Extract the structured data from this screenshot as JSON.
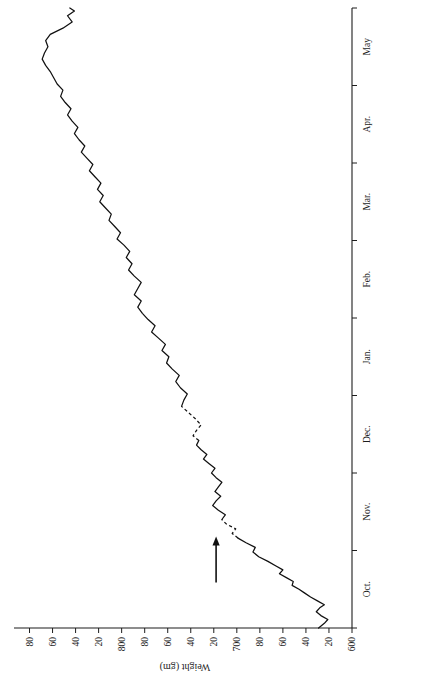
{
  "figure": {
    "name": "weight-growth-curve",
    "orientation_note": "rotated",
    "line_color": "#111111",
    "axis_color": "#1d1d1d",
    "background": "#ffffff"
  },
  "chart_data": {
    "type": "line",
    "title": "",
    "subtitle": "",
    "xlabel": "",
    "ylabel": "Weight (gm)",
    "grid": false,
    "legend": null,
    "ylim": [
      600,
      890
    ],
    "xlim": [
      0,
      8
    ],
    "y_ticks": [
      600,
      620,
      640,
      660,
      680,
      700,
      720,
      740,
      760,
      780,
      800,
      820,
      840,
      860,
      880
    ],
    "y_tick_labels": [
      "600",
      "20",
      "40",
      "60",
      "80",
      "700",
      "20",
      "40",
      "60",
      "80",
      "800",
      "20",
      "40",
      "60",
      "80"
    ],
    "x_ticks": [
      0,
      1,
      2,
      3,
      4,
      5,
      6,
      7,
      8
    ],
    "x_tick_labels": [
      "",
      "",
      "",
      "",
      "",
      "",
      "",
      "",
      ""
    ],
    "categories": [
      "Oct.",
      "Nov.",
      "Dec.",
      "Jan.",
      "Feb.",
      "Mar.",
      "Apr.",
      "May"
    ],
    "month_label_positions": [
      0.5,
      1.5,
      2.5,
      3.5,
      4.5,
      5.5,
      6.5,
      7.5
    ],
    "annotations": [
      {
        "name": "marker-arrow",
        "type": "arrow",
        "x": 1.18,
        "y": 718,
        "direction": "right",
        "text": ""
      }
    ],
    "series": [
      {
        "name": "body-weight",
        "style": "solid-with-interpolated-gaps",
        "x": [
          0.0,
          0.06,
          0.11,
          0.16,
          0.21,
          0.26,
          0.3,
          0.35,
          0.4,
          0.45,
          0.5,
          0.55,
          0.6,
          0.65,
          0.7,
          0.75,
          0.8,
          0.86,
          0.92,
          0.98,
          1.04,
          1.1,
          1.16,
          1.22,
          1.28,
          1.34,
          1.4,
          1.46,
          1.52,
          1.58,
          1.64,
          1.7,
          1.76,
          1.82,
          1.88,
          1.94,
          2.0,
          2.06,
          2.12,
          2.18,
          2.24,
          2.3,
          2.36,
          2.42,
          2.48,
          2.55,
          2.62,
          2.7,
          2.78,
          2.86,
          2.94,
          3.02,
          3.1,
          3.18,
          3.26,
          3.34,
          3.42,
          3.5,
          3.58,
          3.66,
          3.74,
          3.82,
          3.9,
          3.98,
          4.06,
          4.14,
          4.22,
          4.3,
          4.38,
          4.46,
          4.54,
          4.62,
          4.7,
          4.78,
          4.86,
          4.94,
          5.02,
          5.1,
          5.18,
          5.26,
          5.34,
          5.42,
          5.5,
          5.58,
          5.66,
          5.74,
          5.82,
          5.9,
          5.98,
          6.06,
          6.14,
          6.22,
          6.3,
          6.38,
          6.46,
          6.54,
          6.62,
          6.7,
          6.78,
          6.86,
          6.94,
          7.02,
          7.1,
          7.18,
          7.26,
          7.34,
          7.42,
          7.5,
          7.58,
          7.66,
          7.74,
          7.82,
          7.9,
          7.96,
          8.0
        ],
        "y": [
          629,
          624,
          621,
          627,
          631,
          628,
          624,
          630,
          636,
          641,
          646,
          652,
          651,
          657,
          663,
          660,
          666,
          673,
          681,
          686,
          684,
          692,
          699,
          704,
          701,
          709,
          713,
          710,
          716,
          721,
          718,
          714,
          719,
          716,
          713,
          718,
          722,
          719,
          724,
          729,
          726,
          731,
          735,
          733,
          738,
          735,
          731,
          736,
          742,
          748,
          746,
          743,
          749,
          753,
          750,
          756,
          761,
          759,
          765,
          762,
          768,
          774,
          771,
          777,
          782,
          786,
          783,
          789,
          786,
          783,
          789,
          794,
          791,
          796,
          793,
          798,
          804,
          801,
          806,
          811,
          809,
          814,
          819,
          816,
          821,
          818,
          823,
          828,
          825,
          830,
          835,
          832,
          837,
          841,
          838,
          843,
          847,
          844,
          849,
          853,
          851,
          856,
          859,
          862,
          866,
          869,
          867,
          864,
          866,
          862,
          851,
          843,
          847,
          841,
          845
        ],
        "gap_segments": [
          {
            "from_index": 22,
            "to_index": 26
          },
          {
            "from_index": 43,
            "to_index": 49
          }
        ]
      }
    ]
  }
}
